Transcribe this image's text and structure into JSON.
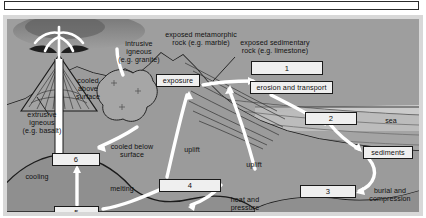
{
  "diagram": {
    "frame": {
      "top_bar_label": ""
    },
    "colors": {
      "background": "#9e9e9e",
      "frame": "#d8d8d8",
      "arrow": "#ffffff",
      "line": "#1a1a1a",
      "box_fill": "#efefef",
      "sky": "#a8a8a8",
      "sea": "#c9c9c9",
      "magma": "#8c8c8c",
      "ash": "#2e2e2e"
    },
    "numbered_boxes": [
      {
        "id": "box-1",
        "label": "1",
        "x": 244,
        "y": 42,
        "w": 72,
        "h": 14
      },
      {
        "id": "box-2",
        "label": "2",
        "x": 298,
        "y": 93,
        "w": 52,
        "h": 13
      },
      {
        "id": "box-3",
        "label": "3",
        "x": 293,
        "y": 166,
        "w": 56,
        "h": 13
      },
      {
        "id": "box-4",
        "label": "4",
        "x": 152,
        "y": 160,
        "w": 62,
        "h": 13
      },
      {
        "id": "box-5",
        "label": "5",
        "x": 47,
        "y": 187,
        "w": 45,
        "h": 13
      },
      {
        "id": "box-6",
        "label": "6",
        "x": 45,
        "y": 134,
        "w": 48,
        "h": 13
      }
    ],
    "named_boxes": [
      {
        "id": "exposure-box",
        "label": "exposure",
        "x": 149,
        "y": 55,
        "w": 44,
        "h": 13
      },
      {
        "id": "erosion-box",
        "label": "erosion and transport",
        "x": 243,
        "y": 62,
        "w": 83,
        "h": 13
      },
      {
        "id": "sediments-box",
        "label": "sediments",
        "x": 356,
        "y": 127,
        "w": 50,
        "h": 13
      }
    ],
    "labels": [
      {
        "id": "intrusive-igneous",
        "text": "intrusive\nigneous\n(e.g. granite)",
        "x": 104,
        "y": 21,
        "w": 56
      },
      {
        "id": "exposed-metamorphic",
        "text": "exposed metamorphic\nrock (e.g. marble)",
        "x": 148,
        "y": 12,
        "w": 92
      },
      {
        "id": "exposed-sedimentary",
        "text": "exposed sedimentary\nrock (e.g. limestone)",
        "x": 222,
        "y": 20,
        "w": 92
      },
      {
        "id": "cooled-above-surface",
        "text": "cooled\nabove\nsurface",
        "x": 62,
        "y": 58,
        "w": 38
      },
      {
        "id": "extrusive-igneous",
        "text": "extrusive\nigneous\n(e.g. basalt)",
        "x": 11,
        "y": 92,
        "w": 48
      },
      {
        "id": "cooled-below-surface",
        "text": "cooled below\nsurface",
        "x": 96,
        "y": 124,
        "w": 58
      },
      {
        "id": "cooling",
        "text": "cooling",
        "x": 13,
        "y": 154,
        "w": 34
      },
      {
        "id": "melting",
        "text": "melting",
        "x": 98,
        "y": 166,
        "w": 34
      },
      {
        "id": "uplift-left",
        "text": "uplift",
        "x": 172,
        "y": 127,
        "w": 26
      },
      {
        "id": "uplift-right",
        "text": "uplift",
        "x": 234,
        "y": 142,
        "w": 26
      },
      {
        "id": "heat-and-pressure",
        "text": "heat and\npressure",
        "x": 216,
        "y": 177,
        "w": 44
      },
      {
        "id": "sea",
        "text": "sea",
        "x": 374,
        "y": 98,
        "w": 20
      },
      {
        "id": "burial-and-compression",
        "text": "burial and\ncompression",
        "x": 355,
        "y": 168,
        "w": 56
      }
    ]
  }
}
